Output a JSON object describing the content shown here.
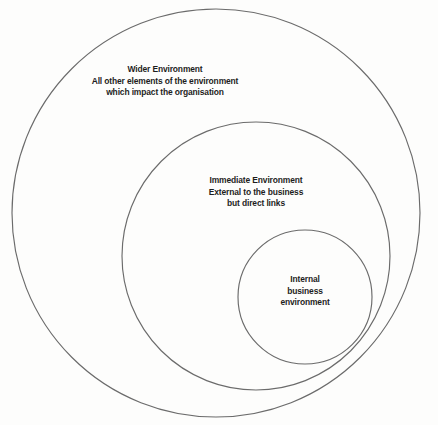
{
  "diagram": {
    "type": "concentric-venn",
    "background_color": "#fdfdfc",
    "stroke_color": "#6b6b6b",
    "text_color": "#1d1d1d",
    "rings": [
      {
        "id": "wider-environment",
        "order": 1,
        "center_x": 216,
        "center_y": 213,
        "radius": 204,
        "label": {
          "heading": "Wider Environment",
          "lines": [
            "Wider Environment",
            "All other elements of the environment",
            "which impact the organisation"
          ]
        }
      },
      {
        "id": "immediate-environment",
        "order": 2,
        "center_x": 256,
        "center_y": 256,
        "radius": 134,
        "label": {
          "heading": "Immediate Environment",
          "lines": [
            "Immediate Environment",
            "External to the business",
            "but direct links"
          ]
        }
      },
      {
        "id": "internal-business-environment",
        "order": 3,
        "center_x": 305,
        "center_y": 297,
        "radius": 67,
        "label": {
          "heading": "Internal business environment",
          "lines": [
            "Internal",
            "business",
            "environment"
          ]
        }
      }
    ]
  }
}
